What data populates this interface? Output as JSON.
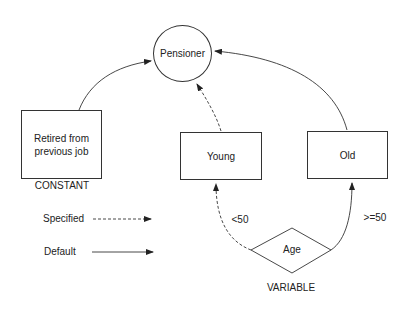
{
  "diagram": {
    "nodes": {
      "pensioner": {
        "label": "Pensioner",
        "shape": "circle"
      },
      "retired": {
        "label_line1": "Retired from",
        "label_line2": "previous job",
        "shape": "rectangle"
      },
      "young": {
        "label": "Young",
        "shape": "rectangle"
      },
      "old": {
        "label": "Old",
        "shape": "rectangle"
      },
      "age": {
        "label": "Age",
        "shape": "diamond"
      }
    },
    "annotations": {
      "constant": "CONSTANT",
      "variable": "VARIABLE"
    },
    "edges": [
      {
        "from": "retired",
        "to": "pensioner",
        "style": "solid"
      },
      {
        "from": "young",
        "to": "pensioner",
        "style": "dashed"
      },
      {
        "from": "old",
        "to": "pensioner",
        "style": "solid"
      },
      {
        "from": "age",
        "to": "young",
        "style": "dashed",
        "label": "<50"
      },
      {
        "from": "age",
        "to": "old",
        "style": "solid",
        "label": ">=50"
      }
    ],
    "legend": {
      "specified": {
        "label": "Specified",
        "style": "dashed"
      },
      "default": {
        "label": "Default",
        "style": "solid"
      }
    },
    "colors": {
      "line": "#333333",
      "text": "#222222",
      "background": "#ffffff"
    }
  }
}
